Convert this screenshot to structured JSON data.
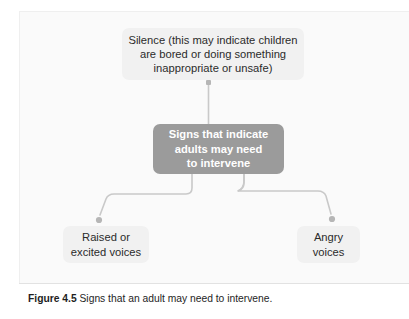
{
  "figure": {
    "caption_label": "Figure 4.5",
    "caption_text": " Signs that an adult may need to intervene.",
    "colors": {
      "page_background": "#ffffff",
      "panel_background": "#fafafa",
      "node_light_background": "#f1f1f1",
      "node_center_background": "#9b9b9b",
      "node_center_text": "#ffffff",
      "node_light_text": "#2b2b2b",
      "connector": "#c9c9c9",
      "divider": "#e2e2e2"
    }
  },
  "diagram": {
    "type": "hierarchy",
    "center": {
      "id": "signs-indicate",
      "label": "Signs that indicate\nadults may need\nto intervene",
      "style": "filled-gray"
    },
    "branches": [
      {
        "id": "silence",
        "label": "Silence (this may indicate children\nare bored or doing something\ninappropriate or unsafe)",
        "position": "top",
        "style": "light"
      },
      {
        "id": "raised-or-excited-voices",
        "label": "Raised or\nexcited voices",
        "position": "bottom-left",
        "style": "light"
      },
      {
        "id": "angry-voices",
        "label": "Angry\nvoices",
        "position": "bottom-right",
        "style": "light"
      }
    ],
    "connector_count": 3
  }
}
